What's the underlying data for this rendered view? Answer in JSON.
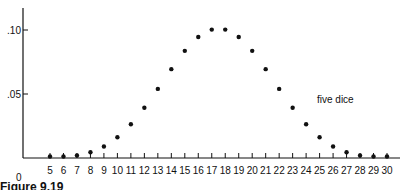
{
  "chart_data": {
    "type": "scatter",
    "title": "",
    "xlabel": "",
    "ylabel": "",
    "annotation": "five dice",
    "origin_label": "0",
    "x": [
      5,
      6,
      7,
      8,
      9,
      10,
      11,
      12,
      13,
      14,
      15,
      16,
      17,
      18,
      19,
      20,
      21,
      22,
      23,
      24,
      25,
      26,
      27,
      28,
      29,
      30
    ],
    "series": [
      {
        "name": "five dice",
        "values": [
          0.0001,
          0.0006,
          0.0019,
          0.0045,
          0.009,
          0.0162,
          0.0264,
          0.0392,
          0.054,
          0.0694,
          0.0837,
          0.0945,
          0.1003,
          0.1003,
          0.0945,
          0.0837,
          0.0694,
          0.054,
          0.0392,
          0.0264,
          0.0162,
          0.009,
          0.0045,
          0.0019,
          0.0006,
          0.0001
        ]
      }
    ],
    "y_ticks": [
      ".05",
      ".10"
    ],
    "y_tick_values": [
      0.05,
      0.1
    ],
    "xlim": [
      5,
      30
    ],
    "ylim": [
      0,
      0.11
    ],
    "grid": false,
    "legend": "none"
  },
  "caption": "Figure 9.19"
}
